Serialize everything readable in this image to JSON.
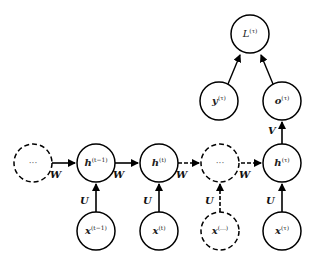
{
  "diagram": {
    "nodes": {
      "h_prev_dots": {
        "label": "···",
        "style": "dashed"
      },
      "h_t_minus_1": {
        "base": "h",
        "sup": "(t−1)",
        "style": "solid"
      },
      "h_t": {
        "base": "h",
        "sup": "(t)",
        "style": "solid"
      },
      "h_dots": {
        "label": "···",
        "style": "dashed"
      },
      "h_tau": {
        "base": "h",
        "sup": "(τ)",
        "style": "solid"
      },
      "x_t_minus_1": {
        "base": "x",
        "sup": "(t−1)",
        "style": "solid"
      },
      "x_t": {
        "base": "x",
        "sup": "(t)",
        "style": "solid"
      },
      "x_dots": {
        "base": "x",
        "sup": "(...)",
        "style": "dashed"
      },
      "x_tau": {
        "base": "x",
        "sup": "(τ)",
        "style": "solid"
      },
      "o_tau": {
        "base": "o",
        "sup": "(τ)",
        "style": "solid"
      },
      "y_tau": {
        "base": "y",
        "sup": "(τ)",
        "style": "solid"
      },
      "L_tau": {
        "base": "L",
        "sup": "(τ)",
        "style": "solid"
      }
    },
    "edge_labels": {
      "W": "W",
      "U": "U",
      "V": "V"
    }
  }
}
